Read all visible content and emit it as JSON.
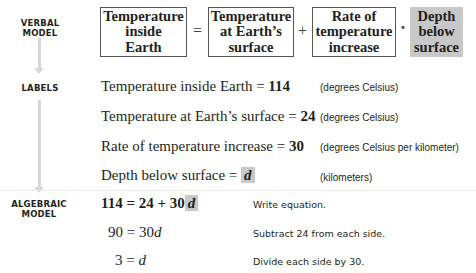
{
  "side_labels": {
    "verbal": [
      "Verbal",
      "Model"
    ],
    "labels": "Labels",
    "algebraic": [
      "Algebraic",
      "Model"
    ]
  },
  "verbal_model": {
    "boxes": [
      {
        "lines": [
          "Temperature",
          "inside",
          "Earth"
        ],
        "highlight": false
      },
      {
        "lines": [
          "Temperature",
          "at Earth’s",
          "surface"
        ],
        "highlight": false
      },
      {
        "lines": [
          "Rate of",
          "temperature",
          "increase"
        ],
        "highlight": false
      },
      {
        "lines": [
          "Depth",
          "below",
          "surface"
        ],
        "highlight": true
      }
    ],
    "operators": [
      "=",
      "+",
      "·"
    ]
  },
  "labels": [
    {
      "text": "Temperature inside Earth = ",
      "value": "114",
      "unit": "(degrees Celsius)"
    },
    {
      "text": "Temperature at Earth’s surface = ",
      "value": "24",
      "unit": "(degrees Celsius)"
    },
    {
      "text": "Rate of temperature increase = ",
      "value": "30",
      "unit": "(degrees Celsius per kilometer)"
    },
    {
      "text": "Depth below surface = ",
      "value": "d",
      "unit": "(kilometers)"
    }
  ],
  "algebraic_model": [
    {
      "lhs": "114 = 24 + 30",
      "var": "d",
      "note": "Write equation."
    },
    {
      "lhs": "90 = 30",
      "var": "d",
      "note": "Subtract 24 from each side."
    },
    {
      "lhs": "3 = ",
      "var": "d",
      "note": "Divide each side by 30."
    }
  ],
  "colors": {
    "highlight": "#c8c8c8",
    "arrow": "#d6d6d6",
    "text": "#231f20"
  }
}
